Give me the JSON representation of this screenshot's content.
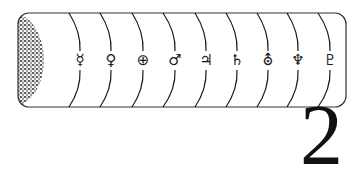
{
  "figure": {
    "number": "2",
    "sun": {
      "label": "sun",
      "fill": "#222222"
    },
    "frame": {
      "stroke": "#333333"
    },
    "planets": [
      {
        "name": "Mercury",
        "symbol": "☿",
        "x": 80,
        "arc_top_x": 69
      },
      {
        "name": "Venus",
        "symbol": "♀",
        "x": 111,
        "arc_top_x": 100
      },
      {
        "name": "Earth",
        "symbol": "⊕",
        "x": 143,
        "arc_top_x": 132
      },
      {
        "name": "Mars",
        "symbol": "♂",
        "x": 175,
        "arc_top_x": 163
      },
      {
        "name": "Jupiter",
        "symbol": "♃",
        "x": 206,
        "arc_top_x": 195
      },
      {
        "name": "Saturn",
        "symbol": "♄",
        "x": 237,
        "arc_top_x": 226
      },
      {
        "name": "Uranus",
        "symbol": "⛢",
        "x": 268,
        "arc_top_x": 257
      },
      {
        "name": "Neptune",
        "symbol": "♆",
        "x": 298,
        "arc_top_x": 287
      },
      {
        "name": "Pluto",
        "symbol": "♇",
        "x": 330,
        "arc_top_x": 318
      }
    ]
  }
}
